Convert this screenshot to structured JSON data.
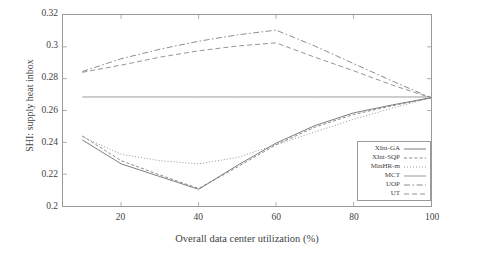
{
  "chart_data": {
    "type": "line",
    "title": "",
    "xlabel": "Overall data center utilization (%)",
    "ylabel": "SHI: supply heat inbox",
    "xlim": [
      5,
      100
    ],
    "ylim": [
      0.2,
      0.32
    ],
    "xticks": [
      20,
      40,
      60,
      80,
      100
    ],
    "xtick_labels": [
      "20",
      "40",
      "60",
      "80",
      "100"
    ],
    "yticks": [
      0.2,
      0.22,
      0.24,
      0.26,
      0.28,
      0.3,
      0.32
    ],
    "ytick_labels": [
      "0.2",
      "0.22",
      "0.24",
      "0.26",
      "0.28",
      "0.3",
      "0.32"
    ],
    "grid": false,
    "legend_position": "lower-right",
    "x": [
      10,
      20,
      30,
      40,
      50,
      60,
      70,
      80,
      90,
      100
    ],
    "series": [
      {
        "name": "XInt-GA",
        "style": "solid",
        "color": "#6e6e6e",
        "values": [
          0.2415,
          0.2265,
          0.2185,
          0.2105,
          0.2255,
          0.2395,
          0.2505,
          0.2585,
          0.2635,
          0.268
        ]
      },
      {
        "name": "XInt-SQP",
        "style": "dashed",
        "color": "#7a7a7a",
        "values": [
          0.244,
          0.2285,
          0.2195,
          0.211,
          0.2245,
          0.2385,
          0.2495,
          0.2575,
          0.263,
          0.268
        ]
      },
      {
        "name": "MinHR-m",
        "style": "dotted",
        "color": "#8a8a8a",
        "values": [
          0.2435,
          0.2325,
          0.2285,
          0.2265,
          0.2305,
          0.2385,
          0.2465,
          0.2545,
          0.2615,
          0.268
        ]
      },
      {
        "name": "MCT",
        "style": "solid",
        "color": "#8f8f8f",
        "values": [
          0.2685,
          0.2685,
          0.2685,
          0.2685,
          0.2685,
          0.2685,
          0.2685,
          0.2685,
          0.2685,
          0.2685
        ]
      },
      {
        "name": "UOP",
        "style": "dashdot",
        "color": "#7e7e7e",
        "values": [
          0.2845,
          0.2925,
          0.2985,
          0.3035,
          0.3075,
          0.3105,
          0.3005,
          0.2895,
          0.2785,
          0.268
        ]
      },
      {
        "name": "UT",
        "style": "dashed-long",
        "color": "#888888",
        "values": [
          0.284,
          0.2885,
          0.2935,
          0.2975,
          0.3005,
          0.3025,
          0.2935,
          0.285,
          0.276,
          0.268
        ]
      }
    ]
  },
  "axes": {
    "frame_color": "#9a9a9a"
  }
}
